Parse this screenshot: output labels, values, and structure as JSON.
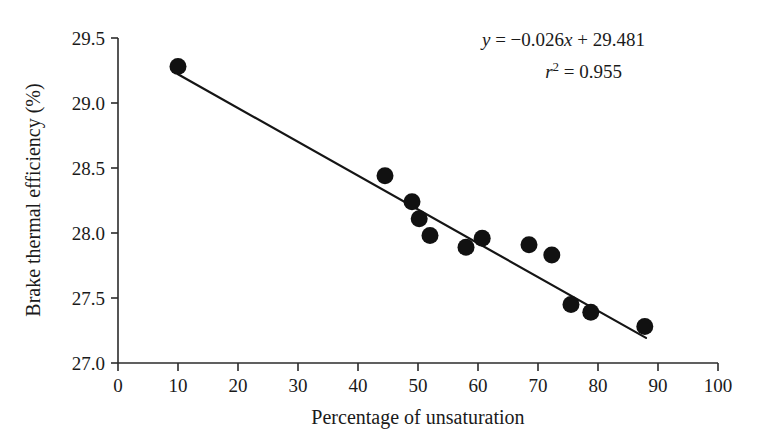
{
  "chart_data": {
    "type": "scatter",
    "title": "",
    "xlabel": "Percentage of unsaturation",
    "ylabel": "Brake thermal efficiency (%)",
    "xlim": [
      0,
      100
    ],
    "ylim": [
      27.0,
      29.5
    ],
    "xticks": [
      0,
      10,
      20,
      30,
      40,
      50,
      60,
      70,
      80,
      90,
      100
    ],
    "yticks": [
      27.0,
      27.5,
      28.0,
      28.5,
      29.0,
      29.5
    ],
    "xtick_labels": [
      "0",
      "10",
      "20",
      "30",
      "40",
      "50",
      "60",
      "70",
      "80",
      "90",
      "100"
    ],
    "ytick_labels": [
      "27.0",
      "27.5",
      "28.0",
      "28.5",
      "29.0",
      "29.5"
    ],
    "grid": false,
    "legend": null,
    "marker": "filled-circle",
    "marker_color": "#111111",
    "line_color": "#151515",
    "points": [
      {
        "x": 10.0,
        "y": 29.28
      },
      {
        "x": 44.5,
        "y": 28.44
      },
      {
        "x": 49.0,
        "y": 28.24
      },
      {
        "x": 50.2,
        "y": 28.11
      },
      {
        "x": 52.0,
        "y": 27.98
      },
      {
        "x": 58.0,
        "y": 27.89
      },
      {
        "x": 60.7,
        "y": 27.96
      },
      {
        "x": 68.5,
        "y": 27.91
      },
      {
        "x": 72.3,
        "y": 27.83
      },
      {
        "x": 75.5,
        "y": 27.45
      },
      {
        "x": 78.8,
        "y": 27.39
      },
      {
        "x": 87.8,
        "y": 27.28
      }
    ],
    "fit": {
      "slope": -0.026,
      "intercept": 29.481,
      "r_squared": 0.955,
      "x_start": 10.0,
      "x_end": 88.0
    },
    "annotations": {
      "equation_y": "y",
      "equation_body": " = −0.026",
      "equation_x": "x",
      "equation_tail": " + 29.481",
      "r_symbol": "r",
      "r_exponent": "2",
      "r_value": " = 0.955"
    }
  }
}
